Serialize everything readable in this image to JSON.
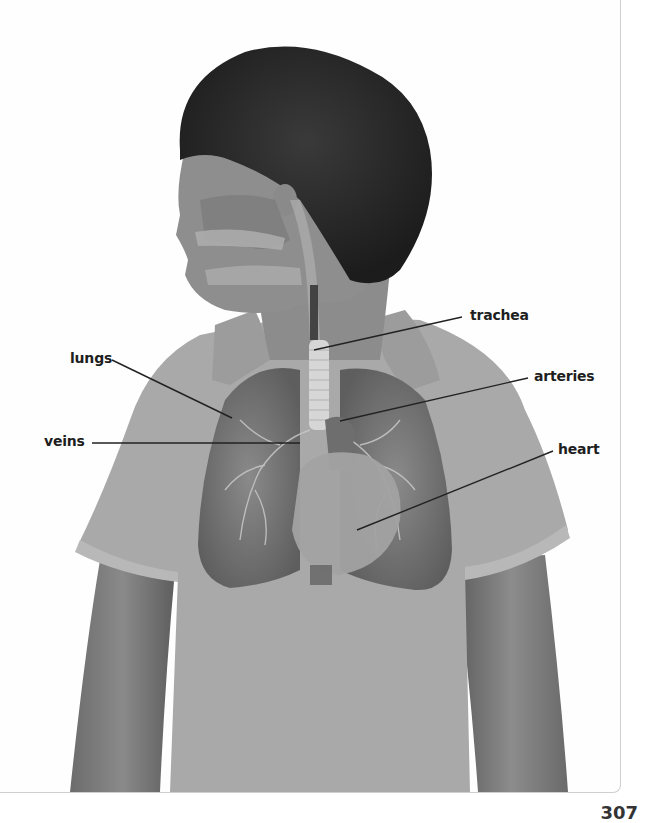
{
  "figure": {
    "labels": {
      "trachea": "trachea",
      "lungs": "lungs",
      "arteries": "arteries",
      "veins": "veins",
      "heart": "heart"
    }
  },
  "page": {
    "number": "307"
  },
  "colors": {
    "hair": "#2a2a2a",
    "skin": "#8a8a8a",
    "shirt": "#a9a9a9",
    "lungs": "#7a7a7a",
    "heart": "#9a9a9a",
    "label_text": "#1e1e1e",
    "leader_line": "#222222"
  }
}
